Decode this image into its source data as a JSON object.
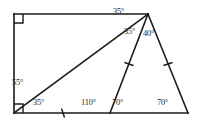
{
  "figure": {
    "background_color": "#ffffff",
    "stroke_color": "#1b1b1b",
    "label_color": "#2a2a2a"
  },
  "vertices": {
    "top_left": {
      "name": "A",
      "x": 14,
      "y": 14
    },
    "apex_top_right": {
      "name": "B",
      "x": 148,
      "y": 14
    },
    "bottom_left": {
      "name": "C",
      "x": 14,
      "y": 113
    },
    "bottom_mid": {
      "name": "D",
      "x": 110,
      "y": 113
    },
    "bottom_right": {
      "name": "E",
      "x": 188,
      "y": 113
    }
  },
  "edges": [
    {
      "name": "top-edge",
      "from": "top_left",
      "to": "apex_top_right"
    },
    {
      "name": "left-edge",
      "from": "top_left",
      "to": "bottom_left"
    },
    {
      "name": "bottom-edge",
      "from": "bottom_left",
      "to": "bottom_right"
    },
    {
      "name": "right-slant-edge",
      "from": "apex_top_right",
      "to": "bottom_right"
    },
    {
      "name": "diagonal-cevian",
      "from": "bottom_left",
      "to": "apex_top_right"
    },
    {
      "name": "inner-cevian",
      "from": "apex_top_right",
      "to": "bottom_mid"
    }
  ],
  "right_angle_marks": [
    {
      "name": "right-angle-top-left",
      "at": "top_left"
    },
    {
      "name": "right-angle-bottom-left",
      "at": "bottom_left"
    }
  ],
  "tick_marks": [
    {
      "name": "tick-bottom-left-segment",
      "on": "bottom-edge",
      "x": 63,
      "y": 113
    },
    {
      "name": "tick-inner-cevian",
      "on": "inner-cevian",
      "x": 129,
      "y": 64
    },
    {
      "name": "tick-right-slant-edge",
      "on": "right-slant-edge",
      "x": 168,
      "y": 64
    }
  ],
  "angle_labels": [
    {
      "name": "angle-apex-upper-left",
      "value": "35°",
      "x": 113,
      "y": 7
    },
    {
      "name": "angle-apex-middle",
      "value": "35°",
      "x": 124,
      "y": 27
    },
    {
      "name": "angle-apex-right",
      "value": "40°",
      "x": 143,
      "y": 29
    },
    {
      "name": "angle-bottom-left-upper",
      "value": "55°",
      "x": 12,
      "y": 78
    },
    {
      "name": "angle-bottom-left-lower",
      "value": "35°",
      "x": 33,
      "y": 98
    },
    {
      "name": "angle-bottom-mid-left",
      "value": "110°",
      "x": 81,
      "y": 98
    },
    {
      "name": "angle-bottom-mid-right",
      "value": "70°",
      "x": 112,
      "y": 98
    },
    {
      "name": "angle-bottom-right",
      "value": "70°",
      "x": 157,
      "y": 98
    }
  ]
}
